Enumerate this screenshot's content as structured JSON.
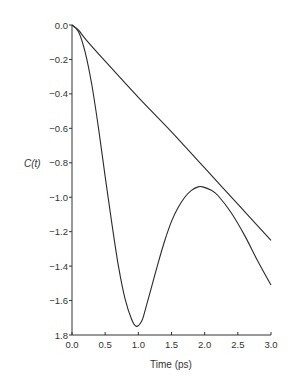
{
  "chart_data": {
    "type": "line",
    "title": "",
    "xlabel": "Time (ps)",
    "ylabel": "C(t)",
    "xlim": [
      0.0,
      3.0
    ],
    "ylim": [
      -1.8,
      0.0
    ],
    "grid": false,
    "legend": null,
    "x_ticks": [
      "0.0",
      "0.5",
      "1.0",
      "1.5",
      "2.0",
      "2.5",
      "3.0"
    ],
    "y_ticks": [
      "0.0",
      "-0.2",
      "-0.4",
      "-0.6",
      "-0.8",
      "-1.0",
      "-1.2",
      "-1.4",
      "-1.6",
      "1.8"
    ],
    "series": [
      {
        "name": "linear",
        "x": [
          0.0,
          0.1,
          0.2,
          0.5,
          1.0,
          1.5,
          2.0,
          2.5,
          3.0
        ],
        "y": [
          0.0,
          -0.03,
          -0.08,
          -0.21,
          -0.42,
          -0.62,
          -0.83,
          -1.04,
          -1.25
        ]
      },
      {
        "name": "oscillating",
        "x": [
          0.0,
          0.1,
          0.2,
          0.3,
          0.4,
          0.5,
          0.6,
          0.7,
          0.8,
          0.9,
          0.97,
          1.05,
          1.1,
          1.2,
          1.3,
          1.4,
          1.5,
          1.6,
          1.7,
          1.8,
          1.9,
          1.97,
          2.1,
          2.2,
          2.4,
          2.6,
          2.8,
          3.0
        ],
        "y": [
          0.0,
          -0.04,
          -0.16,
          -0.35,
          -0.6,
          -0.88,
          -1.15,
          -1.4,
          -1.59,
          -1.71,
          -1.75,
          -1.72,
          -1.66,
          -1.52,
          -1.38,
          -1.25,
          -1.14,
          -1.06,
          -1.0,
          -0.96,
          -0.94,
          -0.94,
          -0.96,
          -0.99,
          -1.09,
          -1.22,
          -1.37,
          -1.51
        ]
      }
    ]
  }
}
